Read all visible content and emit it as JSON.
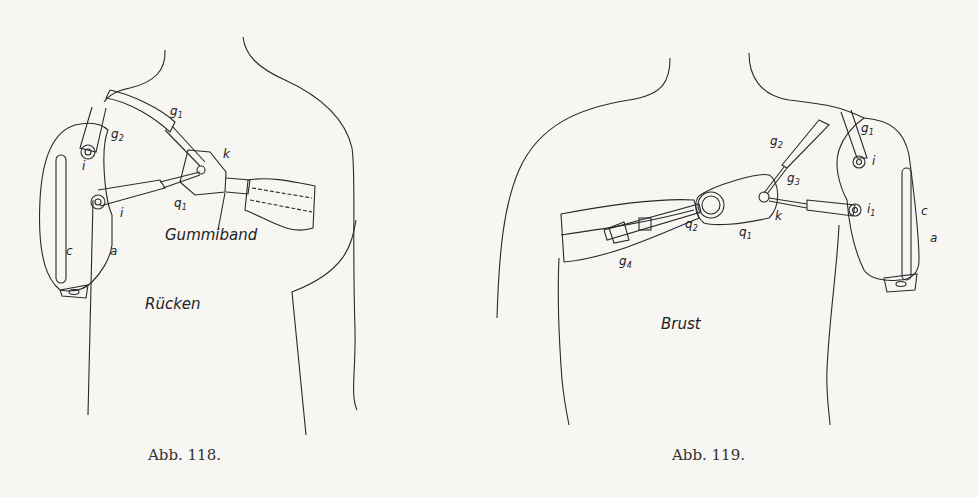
{
  "figures": [
    {
      "id": "abb-118",
      "caption": "Abb. 118.",
      "view_label": "Rücken",
      "band_label": "Gummiband",
      "labels": {
        "g1": "g",
        "g1_sub": "1",
        "g2": "g",
        "g2_sub": "2",
        "k": "k",
        "i_top": "i",
        "i_mid": "i",
        "q1": "q",
        "q1_sub": "1",
        "c": "c",
        "a": "a"
      }
    },
    {
      "id": "abb-119",
      "caption": "Abb. 119.",
      "view_label": "Brust",
      "labels": {
        "g1": "g",
        "g1_sub": "1",
        "g2": "g",
        "g2_sub": "2",
        "g3": "g",
        "g3_sub": "3",
        "g4": "g",
        "g4_sub": "4",
        "i": "i",
        "i1": "i",
        "i1_sub": "1",
        "k": "k",
        "q1": "q",
        "q1_sub": "1",
        "q2": "q",
        "q2_sub": "2",
        "c": "c",
        "a": "a"
      }
    }
  ]
}
